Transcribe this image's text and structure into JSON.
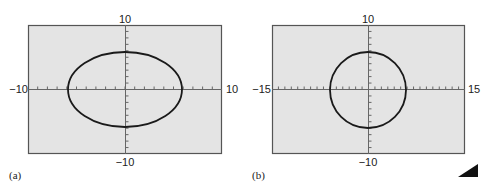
{
  "chart_data": [
    {
      "type": "line",
      "panel_label": "(a)",
      "title": "",
      "xlim": [
        -10,
        10
      ],
      "ylim": [
        -10,
        10
      ],
      "x_tick_labels": {
        "min": "−10",
        "max": "10"
      },
      "y_tick_labels": {
        "min": "−10",
        "max": "10"
      },
      "x_ticks_step": 1,
      "y_ticks_step": 1,
      "grid": false,
      "curve": {
        "shape": "ellipse",
        "center": [
          0,
          0
        ],
        "x_semi_axis": 6,
        "y_semi_axis": 6
      },
      "note": "Non-square viewing window makes the circle appear as a wide ellipse",
      "background": "#e4e4e4"
    },
    {
      "type": "line",
      "panel_label": "(b)",
      "title": "",
      "xlim": [
        -15,
        15
      ],
      "ylim": [
        -10,
        10
      ],
      "x_tick_labels": {
        "min": "−15",
        "max": "15"
      },
      "y_tick_labels": {
        "min": "−10",
        "max": "10"
      },
      "x_ticks_step": 1,
      "y_ticks_step": 1,
      "grid": false,
      "curve": {
        "shape": "circle",
        "center": [
          0,
          0
        ],
        "radius": 6
      },
      "note": "Square viewing window shows the true circle",
      "background": "#e4e4e4"
    }
  ],
  "panels": {
    "a": {
      "label": "(a)",
      "xmin": "−10",
      "xmax": "10",
      "ymin": "−10",
      "ymax": "10"
    },
    "b": {
      "label": "(b)",
      "xmin": "−15",
      "xmax": "15",
      "ymin": "−10",
      "ymax": "10"
    }
  },
  "colors": {
    "plot_bg": "#e4e4e4",
    "frame": "#555555",
    "curve": "#1a1a1a",
    "axis": "#555555"
  }
}
